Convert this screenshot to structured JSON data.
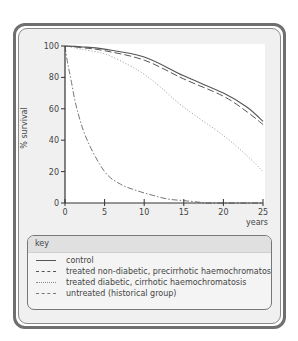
{
  "chart_data": {
    "type": "line",
    "title": "",
    "xlabel": "years",
    "ylabel": "% survival",
    "xlim": [
      0,
      25
    ],
    "ylim": [
      0,
      100
    ],
    "xticks": [
      0,
      5,
      10,
      15,
      20,
      25
    ],
    "yticks": [
      0,
      20,
      40,
      60,
      80,
      100
    ],
    "grid": false,
    "legend_position": "below",
    "legend_title": "key",
    "series": [
      {
        "name": "control",
        "style": "solid",
        "x": [
          0,
          2,
          5,
          10,
          15,
          20,
          23,
          25
        ],
        "y": [
          100,
          99.5,
          98,
          93,
          81,
          70,
          61,
          52
        ]
      },
      {
        "name": "treated non-diabetic, precirrhotic haemochromatosis",
        "style": "dashed",
        "x": [
          0,
          2,
          5,
          10,
          15,
          20,
          23,
          25
        ],
        "y": [
          100,
          99,
          97,
          91,
          79,
          68,
          58,
          50
        ]
      },
      {
        "name": "treated diabetic, cirrhotic haemochromatosis",
        "style": "dotted",
        "x": [
          0,
          2,
          5,
          8,
          10,
          12,
          15,
          20,
          23,
          25
        ],
        "y": [
          100,
          98,
          95,
          88,
          82,
          74,
          61,
          43,
          30,
          20
        ]
      },
      {
        "name": "untreated (historical group)",
        "style": "dash-dot",
        "x": [
          0,
          0.3,
          0.7,
          1.5,
          2.8,
          5,
          7,
          9,
          11,
          13,
          15,
          17,
          18,
          25
        ],
        "y": [
          100,
          90,
          80,
          60,
          40,
          20,
          12,
          8,
          5,
          2.5,
          1.5,
          0.5,
          0,
          0
        ]
      }
    ]
  },
  "legend": {
    "title": "key",
    "items": [
      {
        "label": "control",
        "style": "solid"
      },
      {
        "label": "treated non-diabetic, precirrhotic haemochromatosis",
        "style": "dashed"
      },
      {
        "label": "treated diabetic, cirrhotic haemochromatosis",
        "style": "dotted"
      },
      {
        "label": "untreated (historical group)",
        "style": "dash-dot"
      }
    ]
  },
  "axes": {
    "ylabel": "% survival",
    "xlabel": "years",
    "yticks": [
      "0",
      "20",
      "40",
      "60",
      "80",
      "100"
    ],
    "xticks": [
      "0",
      "5",
      "10",
      "15",
      "20",
      "25"
    ]
  },
  "colors": {
    "line": "#555555",
    "axis": "#333333",
    "frame": "#6f6f6f",
    "panel": "#f0f0f0",
    "plot_bg": "#ffffff"
  }
}
